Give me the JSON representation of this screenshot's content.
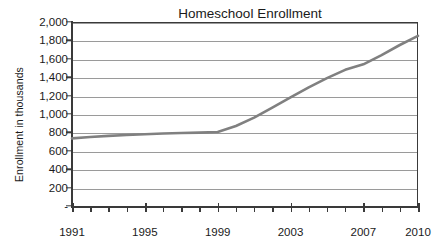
{
  "chart_data": {
    "type": "line",
    "title": "Homeschool Enrollment",
    "xlabel": "",
    "ylabel": "Enrollment in thousands",
    "x": [
      1991,
      1992,
      1993,
      1994,
      1995,
      1996,
      1997,
      1998,
      1999,
      2000,
      2001,
      2002,
      2003,
      2004,
      2005,
      2006,
      2007,
      2008,
      2009,
      2010
    ],
    "values": [
      735,
      750,
      762,
      772,
      780,
      788,
      793,
      798,
      805,
      870,
      960,
      1070,
      1180,
      1290,
      1390,
      1480,
      1540,
      1640,
      1750,
      1850
    ],
    "series": [
      {
        "name": "Homeschool Enrollment",
        "values": [
          735,
          750,
          762,
          772,
          780,
          788,
          793,
          798,
          805,
          870,
          960,
          1070,
          1180,
          1290,
          1390,
          1480,
          1540,
          1640,
          1750,
          1850
        ]
      }
    ],
    "xlim": [
      1991,
      2010
    ],
    "ylim": [
      0,
      2000
    ],
    "ytick_values": [
      0,
      200,
      400,
      600,
      800,
      1000,
      1200,
      1400,
      1600,
      1800,
      2000
    ],
    "ytick_labels": [
      "-",
      "200",
      "400",
      "600",
      "800",
      "1,000",
      "1,200",
      "1,400",
      "1,600",
      "1,800",
      "2,000"
    ],
    "xtick_values": [
      1991,
      1992,
      1993,
      1994,
      1995,
      1996,
      1997,
      1998,
      1999,
      2000,
      2001,
      2002,
      2003,
      2004,
      2005,
      2006,
      2007,
      2008,
      2009,
      2010
    ],
    "xtick_labels": [
      {
        "value": 1991,
        "label": "1991"
      },
      {
        "value": 1995,
        "label": "1995"
      },
      {
        "value": 1999,
        "label": "1999"
      },
      {
        "value": 2003,
        "label": "2003"
      },
      {
        "value": 2007,
        "label": "2007"
      },
      {
        "value": 2010,
        "label": "2010"
      }
    ],
    "grid": true,
    "grid_axis": "y",
    "legend": false,
    "legend_position": "none",
    "line_color": "#808080",
    "grid_color": "#9a9a9a",
    "axis_color": "#3a3a3a",
    "text_color": "#1a1a1a",
    "background_color": "#ffffff"
  }
}
